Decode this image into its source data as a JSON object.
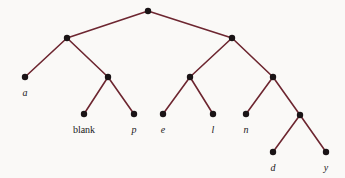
{
  "figure": {
    "background_color": "#faf9f7",
    "edge_color": "#6d2630",
    "node_color": "#1a1416",
    "label_color": "#1a1a1a",
    "node_radius": 3.2,
    "edge_width": 1.6,
    "width": 345,
    "height": 178
  },
  "chart_data": {
    "type": "diagram",
    "subtype": "binary-tree",
    "title": "",
    "nodes": [
      {
        "id": "root",
        "label": "",
        "x": 148,
        "y": 11,
        "kind": "internal",
        "label_style": "none"
      },
      {
        "id": "n-l",
        "label": "",
        "x": 67,
        "y": 38,
        "kind": "internal",
        "label_style": "none"
      },
      {
        "id": "n-r",
        "label": "",
        "x": 232,
        "y": 38,
        "kind": "internal",
        "label_style": "none"
      },
      {
        "id": "a",
        "label": "a",
        "x": 25,
        "y": 77,
        "kind": "leaf",
        "label_style": "italic"
      },
      {
        "id": "n-lr",
        "label": "",
        "x": 108,
        "y": 77,
        "kind": "internal",
        "label_style": "none"
      },
      {
        "id": "n-rl",
        "label": "",
        "x": 190,
        "y": 77,
        "kind": "internal",
        "label_style": "none"
      },
      {
        "id": "n-rr",
        "label": "",
        "x": 273,
        "y": 77,
        "kind": "internal",
        "label_style": "none"
      },
      {
        "id": "blank",
        "label": "blank",
        "x": 84,
        "y": 114,
        "kind": "leaf",
        "label_style": "upright"
      },
      {
        "id": "p",
        "label": "p",
        "x": 134,
        "y": 114,
        "kind": "leaf",
        "label_style": "italic"
      },
      {
        "id": "e",
        "label": "e",
        "x": 163,
        "y": 114,
        "kind": "leaf",
        "label_style": "italic"
      },
      {
        "id": "l",
        "label": "l",
        "x": 213,
        "y": 114,
        "kind": "leaf",
        "label_style": "italic"
      },
      {
        "id": "n",
        "label": "n",
        "x": 246,
        "y": 114,
        "kind": "leaf",
        "label_style": "italic"
      },
      {
        "id": "n-rrr",
        "label": "",
        "x": 300,
        "y": 115,
        "kind": "internal",
        "label_style": "none"
      },
      {
        "id": "d",
        "label": "d",
        "x": 273,
        "y": 152,
        "kind": "leaf",
        "label_style": "italic"
      },
      {
        "id": "y",
        "label": "y",
        "x": 326,
        "y": 152,
        "kind": "leaf",
        "label_style": "italic"
      }
    ],
    "edges": [
      {
        "from": "root",
        "to": "n-l"
      },
      {
        "from": "root",
        "to": "n-r"
      },
      {
        "from": "n-l",
        "to": "a"
      },
      {
        "from": "n-l",
        "to": "n-lr"
      },
      {
        "from": "n-r",
        "to": "n-rl"
      },
      {
        "from": "n-r",
        "to": "n-rr"
      },
      {
        "from": "n-lr",
        "to": "blank"
      },
      {
        "from": "n-lr",
        "to": "p"
      },
      {
        "from": "n-rl",
        "to": "e"
      },
      {
        "from": "n-rl",
        "to": "l"
      },
      {
        "from": "n-rr",
        "to": "n"
      },
      {
        "from": "n-rr",
        "to": "n-rrr"
      },
      {
        "from": "n-rrr",
        "to": "d"
      },
      {
        "from": "n-rrr",
        "to": "y"
      }
    ],
    "leaf_labels": [
      "a",
      "blank",
      "p",
      "e",
      "l",
      "n",
      "d",
      "y"
    ],
    "label_offset_y": 11
  }
}
